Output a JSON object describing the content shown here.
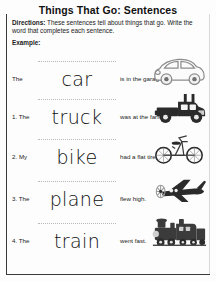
{
  "worksheet": {
    "title": "Things That Go: Sentences",
    "directions_label": "Directions:",
    "directions_text": "These sentences tell about things that go. Write the word that completes each sentence.",
    "example_label": "Example:",
    "rows": [
      {
        "number": "",
        "lead": "The",
        "answer": "car",
        "tail": "is in the garage.",
        "art": "car-illustration"
      },
      {
        "number": "1.",
        "lead": "1. The",
        "answer": "truck",
        "tail": "was at the farm.",
        "art": "truck-illustration"
      },
      {
        "number": "2.",
        "lead": "2. My",
        "answer": "bike",
        "tail": "had a flat tire.",
        "art": "bicycle-illustration"
      },
      {
        "number": "3.",
        "lead": "3. The",
        "answer": "plane",
        "tail": "flew high.",
        "art": "airplane-illustration"
      },
      {
        "number": "4.",
        "lead": "4. The",
        "answer": "train",
        "tail": "went fast.",
        "art": "train-illustration"
      }
    ],
    "colors": {
      "ink": "#111111",
      "guide_line": "#b9b9b9",
      "border": "#3a3a3a",
      "art_dark": "#2b2b2b",
      "art_light": "#8d8d8d"
    }
  }
}
